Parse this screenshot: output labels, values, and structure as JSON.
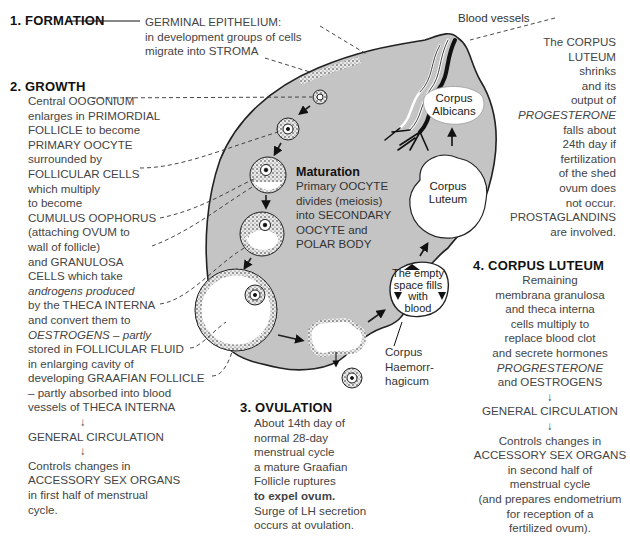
{
  "formation": {
    "heading": "1. FORMATION",
    "lines": [
      "GERMINAL EPITHELIUM:",
      "in development groups of cells",
      "migrate into STROMA"
    ]
  },
  "growth": {
    "heading": "2. GROWTH",
    "lines": [
      "Central OOGONIUM",
      "enlarges in PRIMORDIAL",
      "FOLLICLE to become",
      "PRIMARY OOCYTE",
      "surrounded by",
      "FOLLICULAR CELLS",
      "which multiply",
      "to become",
      "CUMULUS OOPHORUS",
      "(attaching OVUM to",
      "wall of follicle)",
      "and GRANULOSA",
      "CELLS which take",
      "androgens produced",
      "by the THECA INTERNA",
      "and convert them to",
      "OESTROGENS – partly",
      "stored in FOLLICULAR FLUID",
      "in enlarging cavity of",
      "developing GRAAFIAN FOLLICLE",
      "– partly absorbed into blood",
      "vessels of THECA INTERNA"
    ],
    "arrow1": "↓",
    "circulation": "GENERAL CIRCULATION",
    "arrow2": "↓",
    "controls": [
      "Controls changes in",
      "ACCESSORY SEX ORGANS",
      "in first half of menstrual",
      "cycle."
    ]
  },
  "maturation": {
    "heading": "Maturation",
    "lines": [
      "Primary OOCYTE",
      "divides (meiosis)",
      "into SECONDARY",
      "OOCYTE and",
      "POLAR BODY"
    ]
  },
  "ovulation": {
    "heading": "3. OVULATION",
    "lines": [
      "About 14th day of",
      "normal 28-day",
      "menstrual cycle",
      "a mature Graafian",
      "Follicle ruptures",
      "to expel ovum.",
      "Surge of LH secretion",
      "occurs at ovulation."
    ]
  },
  "corpus_luteum": {
    "heading": "4. CORPUS LUTEUM",
    "lines": [
      "Remaining",
      "membrana granulosa",
      "and theca interna",
      "cells multiply to",
      "replace blood clot",
      "and secrete hormones",
      "PROGRESTERONE",
      "and OESTROGENS"
    ],
    "arrow1": "↓",
    "circulation": "GENERAL CIRCULATION",
    "arrow2": "↓",
    "controls": [
      "Controls changes in",
      "ACCESSORY SEX ORGANS",
      "in second half of",
      "menstrual cycle",
      "(and prepares endometrium",
      "for reception of a",
      "fertilized ovum)."
    ]
  },
  "regression": {
    "lines": [
      "The CORPUS",
      "LUTEUM",
      "shrinks",
      "and its",
      "output of",
      "PROGESTERONE",
      "falls about",
      "24th day if",
      "fertilization",
      "of the shed",
      "ovum does",
      "not occur.",
      "PROSTAGLANDINS",
      "are involved."
    ]
  },
  "labels": {
    "blood_vessels": "Blood vessels",
    "corpus_albicans": [
      "Corpus",
      "Albicans"
    ],
    "corpus_luteum": [
      "Corpus",
      "Luteum"
    ],
    "empty_space": [
      "The empty",
      "space fills",
      "with",
      "blood"
    ],
    "corpus_haemorrhagicum": [
      "Corpus",
      "Haemorr-",
      "hagicum"
    ]
  },
  "colors": {
    "stroma": "#c4c4c4",
    "outline": "#222222",
    "text": "#444444",
    "heading": "#111111"
  }
}
